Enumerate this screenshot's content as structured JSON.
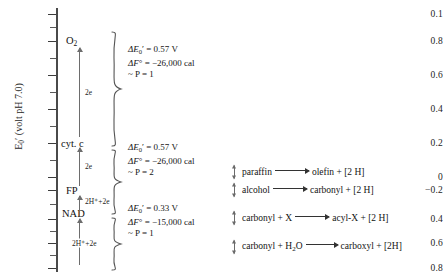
{
  "figure": {
    "axis": {
      "title_main": "E",
      "title_sub": "0",
      "title_prime": "′",
      "title_rest": " (volt pH  7.0)",
      "ticks": [
        {
          "label": "0.1",
          "y": 14
        },
        {
          "label": "0.8",
          "y": 41
        },
        {
          "label": "0.6",
          "y": 75
        },
        {
          "label": "0.4",
          "y": 109
        },
        {
          "label": "0.2",
          "y": 143
        },
        {
          "label": "0",
          "y": 177
        },
        {
          "label": "−0.2",
          "y": 190
        },
        {
          "label": "0.4",
          "y": 219
        },
        {
          "label": "0.6",
          "y": 243
        },
        {
          "label": "0.8",
          "y": 268
        }
      ]
    },
    "species": [
      {
        "name": "O",
        "sub": "2",
        "y": 41
      },
      {
        "name": "cyt. c",
        "sub": "",
        "y": 143
      },
      {
        "name": "FP",
        "sub": "",
        "y": 190
      },
      {
        "name": "NAD",
        "sub": "",
        "y": 213
      }
    ],
    "electron_steps": [
      {
        "label": "2e",
        "y": 92
      },
      {
        "label": "2e",
        "y": 166
      },
      {
        "label": "2H⁺+2e",
        "y": 201
      },
      {
        "label": "2H⁺+2e",
        "y": 243
      }
    ],
    "thermo_blocks": [
      {
        "delta_e": "ΔE",
        "delta_e_sub": "0",
        "delta_e_prime": "′",
        "delta_e_value": "= 0.57 V",
        "delta_f": "ΔF",
        "delta_f_prime": "°",
        "delta_f_value": "= −26,000 cal",
        "p_line": "~ P = 1"
      },
      {
        "delta_e": "ΔE",
        "delta_e_sub": "0",
        "delta_e_prime": "′",
        "delta_e_value": "= 0.57 V",
        "delta_f": "ΔF",
        "delta_f_prime": "°",
        "delta_f_value": "= −26,000 cal",
        "p_line": "~ P = 2"
      },
      {
        "delta_e": "ΔE",
        "delta_e_sub": "0",
        "delta_e_prime": "′",
        "delta_e_value": "= 0.33 V",
        "delta_f": "ΔF",
        "delta_f_prime": "°",
        "delta_f_value": "= −15,000 cal",
        "p_line": "~ P = 1"
      }
    ],
    "reactions": [
      {
        "left": "paraffin",
        "right_a": "olefin + [2 H]",
        "right_sub": "",
        "y": 172
      },
      {
        "left": "alcohol",
        "right_a": "carbonyl + [2 H]",
        "right_sub": "",
        "y": 190
      },
      {
        "left": "carbonyl + X",
        "right_a": "acyl-X + [2 H]",
        "right_sub": "",
        "y": 218
      },
      {
        "left": "carbonyl + H",
        "left_sub": "2",
        "left_tail": "O",
        "right_a": "carboxyl + [2H]",
        "right_sub": "",
        "y": 247
      }
    ]
  }
}
